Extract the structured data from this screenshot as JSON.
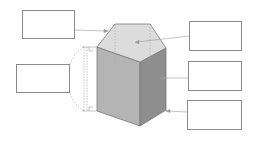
{
  "diagram": {
    "colors": {
      "top_face": "#dcdcdc",
      "left_face": "#b4b4b4",
      "right_face": "#8e8e8e",
      "edge": "#7a7a7a",
      "box_border": "#8a8a8a",
      "leader_line": "#9a9a9a"
    },
    "label_boxes": [
      {
        "id": "top-left",
        "text": "",
        "points_to": "top-vertex-edge"
      },
      {
        "id": "left",
        "text": "",
        "points_to": "height"
      },
      {
        "id": "right-1",
        "text": "",
        "points_to": "top-face"
      },
      {
        "id": "right-2",
        "text": "",
        "points_to": "lateral-face"
      },
      {
        "id": "right-3",
        "text": "",
        "points_to": "bottom-vertex"
      }
    ]
  }
}
